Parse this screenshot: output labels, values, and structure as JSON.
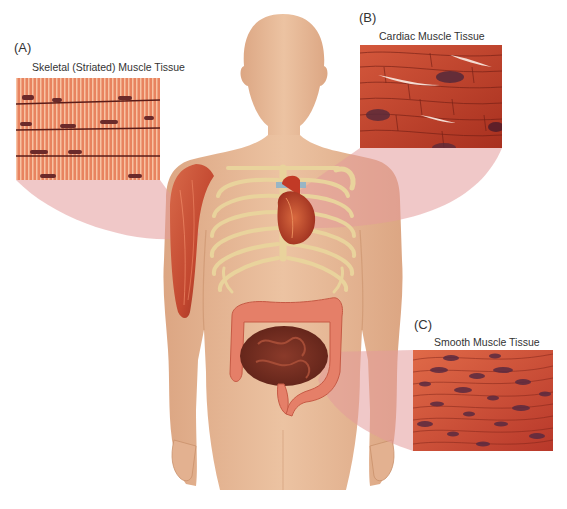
{
  "figure": {
    "colors": {
      "skin": "#e8bb98",
      "skin_shadow": "#d9a27c",
      "bone": "#efdcaa",
      "muscle": "#c9553a",
      "connector": "#e8a0a0",
      "background": "#ffffff"
    }
  },
  "panels": [
    {
      "id": "A",
      "letter": "(A)",
      "title": "Skeletal (Striated) Muscle Tissue",
      "location_on_body": "upper arm (biceps/deltoid)",
      "tissue_color": "#e0734f"
    },
    {
      "id": "B",
      "letter": "(B)",
      "title": "Cardiac Muscle Tissue",
      "location_on_body": "heart",
      "tissue_color": "#c94a35"
    },
    {
      "id": "C",
      "letter": "(C)",
      "title": "Smooth Muscle Tissue",
      "location_on_body": "intestines",
      "tissue_color": "#d25a44"
    }
  ]
}
